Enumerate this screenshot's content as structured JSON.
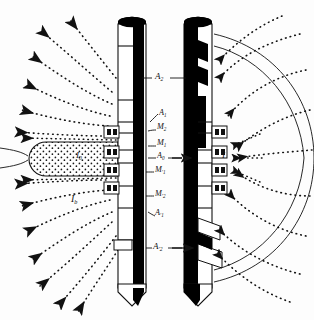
{
  "figure": {
    "type": "dual-laterolog-current-distribution",
    "title": "",
    "width": 314,
    "height": 320,
    "background": "#fdfdfd",
    "ink": "#111111"
  },
  "tools": [
    {
      "id": "left-tool",
      "name": "deep-laterolog-sonde",
      "x_center": 133,
      "body_top": 18,
      "body_bottom": 292,
      "body_width": 30,
      "mandrel_color": "#000000",
      "housing_color": "#ffffff",
      "tip": "conical",
      "head": "elliptical-cap"
    },
    {
      "id": "right-tool",
      "name": "shallow-laterolog-sonde",
      "x_center": 198,
      "body_top": 18,
      "body_bottom": 292,
      "body_width": 30,
      "mandrel_color": "#000000",
      "housing_color": "#ffffff",
      "tip": "conical",
      "head": "elliptical-cap"
    }
  ],
  "electrode_labels": [
    {
      "key": "A2",
      "base": "A",
      "sub": "2",
      "x": 157,
      "y": 78,
      "role": "upper-current-return-electrode"
    },
    {
      "key": "A1",
      "base": "A",
      "sub": "1",
      "x": 161,
      "y": 115,
      "role": "upper-focusing-electrode"
    },
    {
      "key": "M2",
      "base": "M",
      "sub": "2",
      "x": 159,
      "y": 129,
      "role": "upper-measure-electrode-2"
    },
    {
      "key": "M1",
      "base": "M",
      "sub": "1",
      "x": 159,
      "y": 145,
      "role": "upper-measure-electrode-1"
    },
    {
      "key": "A0",
      "base": "A",
      "sub": "0",
      "x": 159,
      "y": 158,
      "role": "main-current-electrode"
    },
    {
      "key": "M1p",
      "base": "M",
      "sub": "′1",
      "x": 157,
      "y": 172,
      "role": "lower-measure-electrode-1"
    },
    {
      "key": "M2p",
      "base": "M",
      "sub": "′2",
      "x": 157,
      "y": 196,
      "role": "lower-measure-electrode-2"
    },
    {
      "key": "A1p",
      "base": "A",
      "sub": "′1",
      "x": 157,
      "y": 215,
      "role": "lower-focusing-electrode"
    },
    {
      "key": "A2p",
      "base": "A",
      "sub": "′2",
      "x": 155,
      "y": 248,
      "role": "lower-current-return-electrode"
    }
  ],
  "current_labels": [
    {
      "key": "Ib",
      "base": "I",
      "sub": "b",
      "x": 73,
      "y": 200,
      "note": "bucking / focusing current, left field"
    },
    {
      "key": "I0_lobe",
      "base": "I",
      "sub": "0",
      "x": 77,
      "y": 156,
      "note": "survey current inside stippled lobe"
    },
    {
      "key": "I_right",
      "base": "I",
      "sub": "",
      "x": 223,
      "y": 157,
      "note": "current at shallow-laterolog borehole"
    }
  ],
  "features": {
    "stippled_lobe": {
      "name": "survey-current-beam",
      "fill": "stipple",
      "cx": 78,
      "cy": 158,
      "rx": 48,
      "ry": 18
    },
    "flow_lines_left": {
      "style": "dotted",
      "arrowhead": "left",
      "count": 11
    },
    "flow_lines_right": {
      "style": "dotted",
      "arrowhead": "left",
      "count": 9
    },
    "equipotential_arcs_right": {
      "style": "solid-thin",
      "count": 3
    },
    "electrode_pads": {
      "shape": "small-rectangle",
      "count_per_side": 6
    }
  },
  "legend": {
    "visible": false,
    "items": []
  }
}
